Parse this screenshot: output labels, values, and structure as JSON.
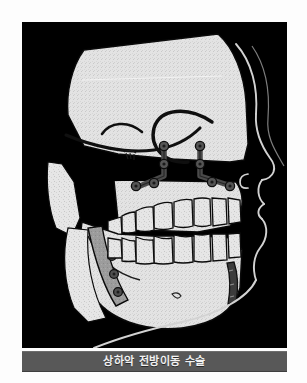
{
  "figure": {
    "caption": "상하악 전방이동 수술",
    "panel": {
      "background_color": "#000000",
      "bone_color": "#e4e4e4",
      "outline_color": "#000000",
      "soft_tissue_line_color": "#cfcfcf",
      "hardware_color": "#4a4a4a",
      "graft_color": "#9a9a9a"
    },
    "caption_bar": {
      "background_color": "#585858",
      "text_color": "#f2f2f2"
    },
    "anatomy": [
      {
        "name": "cranium",
        "label": "Cranium"
      },
      {
        "name": "cranial-base-line",
        "label": "Cranial base"
      },
      {
        "name": "sella-turcica",
        "label": "Sella turcica"
      },
      {
        "name": "orbital-rim",
        "label": "Orbital rim"
      },
      {
        "name": "maxilla",
        "label": "Maxilla"
      },
      {
        "name": "mandible",
        "label": "Mandible"
      },
      {
        "name": "mandibular-ramus",
        "label": "Mandibular ramus"
      },
      {
        "name": "upper-teeth",
        "label": "Upper dentition"
      },
      {
        "name": "lower-teeth",
        "label": "Lower dentition"
      },
      {
        "name": "soft-tissue-profile",
        "label": "Soft tissue profile"
      },
      {
        "name": "nose",
        "label": "Nose"
      },
      {
        "name": "upper-lip",
        "label": "Upper lip"
      },
      {
        "name": "lower-lip",
        "label": "Lower lip"
      },
      {
        "name": "chin",
        "label": "Chin"
      }
    ],
    "hardware": [
      {
        "name": "lefort-plate-anterior",
        "label": "Le Fort I fixation plate",
        "screws": 4
      },
      {
        "name": "lefort-plate-posterior",
        "label": "Le Fort I fixation plate",
        "screws": 4
      },
      {
        "name": "sagittal-split-screws",
        "label": "Sagittal split osteotomy screws",
        "screws": 3
      },
      {
        "name": "genioplasty-plate",
        "label": "Chin fixation plate",
        "screws": 0
      }
    ]
  }
}
